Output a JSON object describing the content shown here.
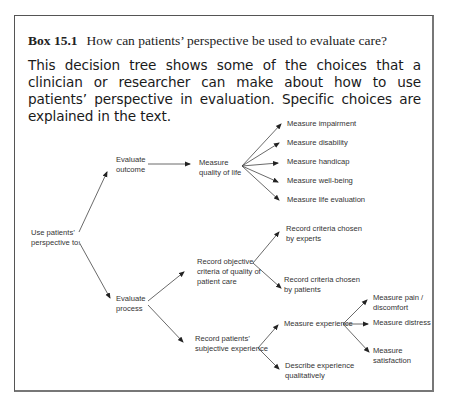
{
  "box": {
    "label": "Box 15.1",
    "title": "How can patients’ perspective be used to evaluate care?",
    "intro": "This decision tree shows some of the choices that a clinician or researcher can make about how to use patients’ perspective in evaluation. Specific choices are explained in the text."
  },
  "tree": {
    "root": [
      "Use patients’",
      "perspective to:"
    ],
    "evaluate_outcome": [
      "Evaluate",
      "outcome"
    ],
    "measure_qol": [
      "Measure",
      "quality of life"
    ],
    "qol_children": [
      "Measure impairment",
      "Measure disability",
      "Measure handicap",
      "Measure well-being",
      "Measure life evaluation"
    ],
    "evaluate_process": [
      "Evaluate",
      "process"
    ],
    "record_objective": [
      "Record objective",
      "criteria of quality of",
      "patient care"
    ],
    "criteria_experts": [
      "Record criteria chosen",
      "by experts"
    ],
    "criteria_patients": [
      "Record criteria chosen",
      "by patients"
    ],
    "record_subjective": [
      "Record patients’",
      "subjective experience"
    ],
    "measure_experience": "Measure experience",
    "pain": [
      "Measure pain /",
      "discomfort"
    ],
    "distress": "Measure distress",
    "satisfaction": [
      "Measure",
      "satisfaction"
    ],
    "describe_qualitative": [
      "Describe experience",
      "qualitatively"
    ]
  }
}
